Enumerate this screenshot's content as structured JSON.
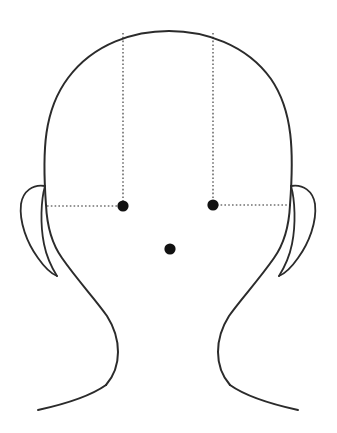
{
  "figure": {
    "background_color": "#ffffff",
    "stroke_color": "#2b2b2b",
    "marker_color": "#111111",
    "canvas": {
      "width": 337,
      "height": 433
    }
  },
  "markers": [
    {
      "id": "point-left",
      "label": "left point",
      "x": 123,
      "y": 206,
      "radius": 5.6,
      "color": "#111111"
    },
    {
      "id": "point-right",
      "label": "right point",
      "x": 213,
      "y": 205,
      "radius": 5.6,
      "color": "#111111"
    },
    {
      "id": "point-center",
      "label": "center point",
      "x": 170,
      "y": 249,
      "radius": 5.6,
      "color": "#111111"
    }
  ],
  "guides": [
    {
      "id": "vertical-left",
      "orientation": "vertical",
      "from_x": 123,
      "from_y": 33,
      "to_x": 123,
      "to_y": 206
    },
    {
      "id": "vertical-right",
      "orientation": "vertical",
      "from_x": 213,
      "from_y": 33,
      "to_x": 213,
      "to_y": 205
    },
    {
      "id": "horizontal-left",
      "orientation": "horizontal",
      "from_x": 47,
      "from_y": 206,
      "to_x": 123,
      "to_y": 206
    },
    {
      "id": "horizontal-right",
      "orientation": "horizontal",
      "from_x": 213,
      "from_y": 205,
      "to_x": 290,
      "to_y": 205
    }
  ],
  "paths": {
    "skull_and_face": "M 46 205 C 42 150 44 110 68 78 C 94 43 135 31 169 31 C 204 31 246 44 271 79 C 293 111 294 152 290 205",
    "left_jaw": "M 46 205 C 47 226 52 244 62 258 C 78 281 96 300 107 316 C 114 327 118 340 118 352 C 118 366 113 377 106 385",
    "right_jaw": "M 290 205 C 289 226 284 244 274 258 C 258 281 240 300 229 316 C 222 327 218 340 218 352 C 218 366 223 377 230 385",
    "left_shoulder": "M 106 385 C 92 395 70 403 38 410",
    "right_shoulder": "M 230 385 C 244 395 266 403 298 410",
    "left_ear_outer": "M 45 186 C 33 184 23 191 21 204 C 19 222 27 243 38 258 C 45 268 52 274 57 276",
    "left_ear_inner": "M 45 186 C 41 200 40 224 44 244 C 47 259 52 268 57 276",
    "right_ear_outer": "M 291 186 C 303 184 313 191 315 204 C 317 222 309 243 298 258 C 291 268 284 274 279 276",
    "right_ear_inner": "M 291 186 C 295 200 296 224 292 244 C 289 259 284 268 279 276"
  }
}
